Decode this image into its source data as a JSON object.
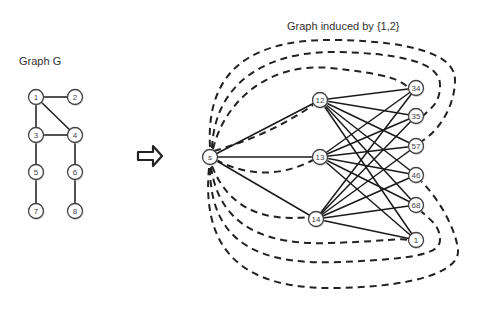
{
  "left_title": "Graph G",
  "right_title": "Graph induced by {1,2}",
  "graph_g": {
    "nodes": [
      {
        "id": "1",
        "x": 36,
        "y": 97
      },
      {
        "id": "2",
        "x": 75,
        "y": 97
      },
      {
        "id": "3",
        "x": 36,
        "y": 135
      },
      {
        "id": "4",
        "x": 75,
        "y": 135
      },
      {
        "id": "5",
        "x": 36,
        "y": 172
      },
      {
        "id": "6",
        "x": 75,
        "y": 172
      },
      {
        "id": "7",
        "x": 36,
        "y": 211
      },
      {
        "id": "8",
        "x": 75,
        "y": 211
      }
    ],
    "edges": [
      [
        "1",
        "2"
      ],
      [
        "1",
        "3"
      ],
      [
        "1",
        "4"
      ],
      [
        "3",
        "4"
      ],
      [
        "3",
        "5"
      ],
      [
        "5",
        "7"
      ],
      [
        "4",
        "6"
      ],
      [
        "6",
        "8"
      ]
    ]
  },
  "induced_graph": {
    "nodes": [
      {
        "id": "s",
        "label": "s",
        "x": 210,
        "y": 157
      },
      {
        "id": "12",
        "label": "12",
        "x": 320,
        "y": 100
      },
      {
        "id": "13",
        "label": "13",
        "x": 320,
        "y": 157
      },
      {
        "id": "14",
        "label": "14",
        "x": 316,
        "y": 219
      },
      {
        "id": "34",
        "label": "34",
        "x": 416,
        "y": 88
      },
      {
        "id": "35",
        "label": "35",
        "x": 416,
        "y": 116
      },
      {
        "id": "57",
        "label": "57",
        "x": 416,
        "y": 146
      },
      {
        "id": "46",
        "label": "46",
        "x": 416,
        "y": 175
      },
      {
        "id": "68",
        "label": "68",
        "x": 416,
        "y": 205
      },
      {
        "id": "1",
        "label": "1",
        "x": 416,
        "y": 240
      }
    ],
    "solid_edges_from_s": [
      "12",
      "13",
      "14"
    ],
    "middle_nodes": [
      "12",
      "13",
      "14"
    ],
    "right_nodes": [
      "34",
      "35",
      "57",
      "46",
      "68",
      "1"
    ],
    "dashed_targets": [
      "34",
      "35",
      "57",
      "46",
      "68",
      "1",
      "12",
      "13",
      "14"
    ]
  },
  "arrow": {
    "direction": "right"
  }
}
